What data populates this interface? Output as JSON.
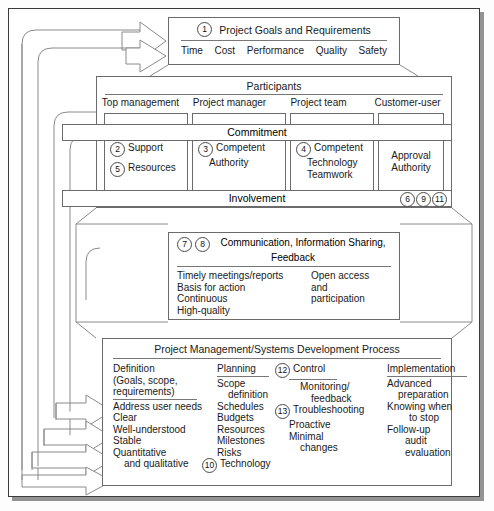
{
  "goals": {
    "number": "1",
    "title": "Project Goals and Requirements",
    "items": [
      "Time",
      "Cost",
      "Performance",
      "Quality",
      "Safety"
    ]
  },
  "participants": {
    "band_label": "Participants",
    "columns": [
      "Top management",
      "Project manager",
      "Project team",
      "Customer-user"
    ]
  },
  "commitment": {
    "band_label": "Commitment",
    "cells": [
      {
        "lines": [
          {
            "num": "2",
            "text": "Support"
          },
          {
            "num": "5",
            "text": "Resources"
          }
        ]
      },
      {
        "lines": [
          {
            "num": "3",
            "text": "Competent"
          },
          {
            "num": "",
            "text": "Authority"
          }
        ]
      },
      {
        "lines": [
          {
            "num": "4",
            "text": "Competent"
          },
          {
            "num": "",
            "text": "Technology"
          },
          {
            "num": "",
            "text": "Teamwork"
          }
        ]
      },
      {
        "lines": [
          {
            "num": "",
            "text": "Approval"
          },
          {
            "num": "",
            "text": "Authority"
          }
        ]
      }
    ]
  },
  "involvement": {
    "band_label": "Involvement",
    "numbers": [
      "6",
      "9",
      "11"
    ]
  },
  "communication": {
    "numbers": [
      "7",
      "8"
    ],
    "title_line1": "Communication, Information Sharing,",
    "title_line2": "Feedback",
    "left_items": [
      "Timely meetings/reports",
      "Basis for action",
      "Continuous",
      "High-quality"
    ],
    "right_items": [
      "Open access",
      "and",
      "participation"
    ]
  },
  "process": {
    "title": "Project Management/Systems Development Process",
    "columns": [
      {
        "header": "Definition",
        "header_lines": [
          "Definition",
          "(Goals, scope,",
          "requirements)"
        ],
        "items": [
          "Address user needs",
          "Clear",
          "Well-understood",
          "Stable",
          "Quantitative",
          "and qualitative"
        ],
        "item_numbers": [
          "",
          "",
          "",
          "",
          "",
          ""
        ]
      },
      {
        "header": "Planning",
        "header_lines": [
          "Planning"
        ],
        "items": [
          "Scope",
          "definition",
          "Schedules",
          "Budgets",
          "Resources",
          "Milestones",
          "Risks",
          "Technology"
        ],
        "item_numbers": [
          "",
          "",
          "",
          "",
          "",
          "",
          "",
          "10"
        ]
      },
      {
        "header": "Control",
        "header_number": "12",
        "header_lines": [
          "Control"
        ],
        "items": [
          "Monitoring/",
          "feedback",
          "Troubleshooting",
          "Proactive",
          "Minimal",
          "changes"
        ],
        "item_numbers": [
          "",
          "",
          "13",
          "",
          "",
          ""
        ]
      },
      {
        "header": "Implementation",
        "header_lines": [
          "Implementation"
        ],
        "items": [
          "Advanced",
          "preparation",
          "Knowing when",
          "to stop",
          "Follow-up",
          "audit",
          "evaluation"
        ],
        "item_numbers": [
          "",
          "",
          "",
          "",
          "",
          "",
          ""
        ]
      }
    ]
  },
  "colors": {
    "frame": "#3a3a3a",
    "box": "#6b6b6b",
    "text": "#1a1a1a",
    "rule": "#777777"
  }
}
